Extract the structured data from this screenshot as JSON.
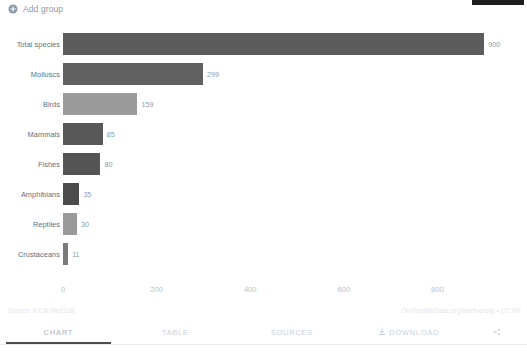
{
  "toolbar": {
    "add_group_label": "Add group",
    "add_group_icon": "plus-circle-icon"
  },
  "footer": {
    "source_note": "Source: IUCN Red List",
    "attribution": "OurWorldInData.org/biodiversity • CC BY"
  },
  "tabs": [
    {
      "label": "CHART",
      "name": "tab-chart",
      "active": true
    },
    {
      "label": "TABLE",
      "name": "tab-table",
      "active": false
    },
    {
      "label": "SOURCES",
      "name": "tab-sources",
      "active": false
    },
    {
      "label": "DOWNLOAD",
      "name": "tab-download",
      "active": false,
      "icon": "download-icon"
    },
    {
      "label": "",
      "name": "tab-share",
      "active": false,
      "icon": "share-icon"
    }
  ],
  "chart_data": {
    "type": "bar",
    "orientation": "horizontal",
    "title": "",
    "subtitle": "",
    "xlabel": "",
    "ylabel": "",
    "xlim": [
      0,
      940
    ],
    "xticks": [
      0,
      200,
      400,
      600,
      800
    ],
    "xtick_labels": [
      "0",
      "200",
      "400",
      "600",
      "800"
    ],
    "grid": false,
    "legend": "none",
    "categories": [
      "Total species",
      "Molluscs",
      "Birds",
      "Mammals",
      "Fishes",
      "Amphibians",
      "Reptiles",
      "Crustaceans"
    ],
    "values": [
      900,
      299,
      159,
      85,
      80,
      35,
      30,
      11
    ],
    "value_labels": [
      "900",
      "299",
      "159",
      "85",
      "80",
      "35",
      "30",
      "11"
    ],
    "colors": [
      "#5c5c5c",
      "#616161",
      "#9b9b9b",
      "#585858",
      "#555555",
      "#4b4b4b",
      "#9a9a9a",
      "#7a7a7a"
    ]
  }
}
